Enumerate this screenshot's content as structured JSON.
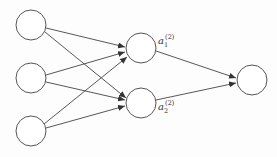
{
  "diagram": {
    "type": "neural-network",
    "layers": [
      {
        "name": "input",
        "nodes": [
          {
            "cx": 31,
            "cy": 25
          },
          {
            "cx": 31,
            "cy": 78
          },
          {
            "cx": 31,
            "cy": 131
          }
        ]
      },
      {
        "name": "hidden",
        "nodes": [
          {
            "cx": 141,
            "cy": 48,
            "label": "a",
            "sub": "1",
            "sup": "(2)"
          },
          {
            "cx": 141,
            "cy": 103,
            "label": "a",
            "sub": "2",
            "sup": "(2)"
          }
        ]
      },
      {
        "name": "output",
        "nodes": [
          {
            "cx": 252,
            "cy": 80
          }
        ]
      }
    ],
    "labels": {
      "h1_base": "a",
      "h1_sub": "1",
      "h1_sup": "(2)",
      "h2_base": "a",
      "h2_sub": "2",
      "h2_sup": "(2)"
    },
    "node_radius": 15,
    "stroke_color": "#555555"
  }
}
